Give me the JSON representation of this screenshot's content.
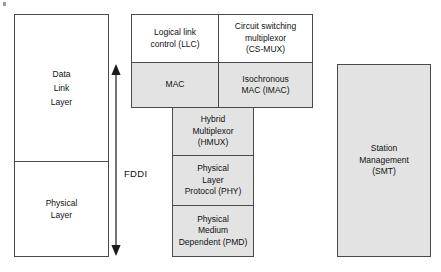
{
  "diagram": {
    "colors": {
      "shaded_fill": "#e3e3e3",
      "plain_fill": "#ffffff",
      "border": "#4a4a4a",
      "text": "#111111"
    }
  },
  "osi": {
    "data_link": {
      "lines": [
        "Data",
        "Link",
        "Layer"
      ]
    },
    "physical": {
      "lines": [
        "Physical",
        "Layer"
      ]
    }
  },
  "scope": {
    "label": "FDDI",
    "arrow": "double-headed-vertical-arrow"
  },
  "fddi_layers": {
    "llc": {
      "lines": [
        "Logical link",
        "control (LLC)"
      ],
      "shaded": false
    },
    "csmux": {
      "lines": [
        "Circuit switching",
        "multiplexor",
        "(CS-MUX)"
      ],
      "shaded": false
    },
    "mac": {
      "lines": [
        "MAC"
      ],
      "shaded": true
    },
    "imac": {
      "lines": [
        "Isochronous",
        "MAC (IMAC)"
      ],
      "shaded": true
    },
    "hmux": {
      "lines": [
        "Hybrid",
        "Multiplexor",
        "(HMUX)"
      ],
      "shaded": true
    },
    "phy": {
      "lines": [
        "Physical",
        "Layer",
        "Protocol (PHY)"
      ],
      "shaded": true
    },
    "pmd": {
      "lines": [
        "Physical",
        "Medium",
        "Dependent (PMD)"
      ],
      "shaded": true
    }
  },
  "management": {
    "smt": {
      "lines": [
        "Station",
        "Management",
        "(SMT)"
      ],
      "shaded": true
    }
  }
}
